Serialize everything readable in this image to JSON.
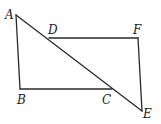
{
  "diagram": {
    "type": "geometry",
    "points": {
      "A": {
        "label": "A",
        "x": 16,
        "y": 15
      },
      "B": {
        "label": "B",
        "x": 20,
        "y": 89
      },
      "C": {
        "label": "C",
        "x": 112,
        "y": 89
      },
      "D": {
        "label": "D",
        "x": 49,
        "y": 38
      },
      "E": {
        "label": "E",
        "x": 142,
        "y": 111
      },
      "F": {
        "label": "F",
        "x": 138,
        "y": 38
      }
    },
    "segments": [
      "AB",
      "BC",
      "AE",
      "DF",
      "FE"
    ],
    "labels": [
      "A",
      "B",
      "C",
      "D",
      "E",
      "F"
    ]
  }
}
